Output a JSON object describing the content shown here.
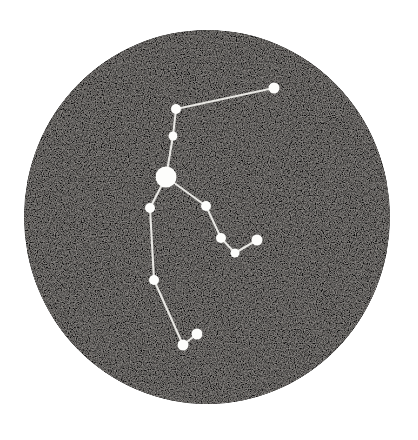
{
  "figure": {
    "background_color": "#ffffff",
    "canvas": {
      "width": 418,
      "height": 440
    }
  },
  "sky_disc": {
    "name": "circular sky field",
    "center_x": 207,
    "center_y": 217,
    "radius_x": 183,
    "radius_y": 187,
    "fill_color": "#0d0c0c",
    "texture": "grainy halftone speckle with faint horizontal banding",
    "speckle_color": "#6e6a66"
  },
  "chart_data": {
    "type": "scatter",
    "xlabel": "",
    "ylabel": "",
    "xlim": [
      24,
      390
    ],
    "ylim": [
      30,
      405
    ],
    "grid": false,
    "legend": "none",
    "star_color": "#fdfdfb",
    "line_color": "#e8e7e3",
    "stars": [
      {
        "id": "s1",
        "x": 274,
        "y": 88,
        "r": 5.5,
        "magnitude_rank": 2
      },
      {
        "id": "s2",
        "x": 176,
        "y": 109,
        "r": 5.0,
        "magnitude_rank": 3
      },
      {
        "id": "s3",
        "x": 173,
        "y": 136,
        "r": 4.5,
        "magnitude_rank": 4
      },
      {
        "id": "s4",
        "x": 166,
        "y": 177,
        "r": 10.5,
        "magnitude_rank": 1
      },
      {
        "id": "s5",
        "x": 150,
        "y": 208,
        "r": 5.0,
        "magnitude_rank": 3
      },
      {
        "id": "s6",
        "x": 206,
        "y": 206,
        "r": 5.0,
        "magnitude_rank": 3
      },
      {
        "id": "s7",
        "x": 221,
        "y": 238,
        "r": 5.0,
        "magnitude_rank": 3
      },
      {
        "id": "s8",
        "x": 235,
        "y": 253,
        "r": 4.5,
        "magnitude_rank": 4
      },
      {
        "id": "s9",
        "x": 257,
        "y": 240,
        "r": 5.5,
        "magnitude_rank": 2
      },
      {
        "id": "s10",
        "x": 154,
        "y": 280,
        "r": 5.0,
        "magnitude_rank": 3
      },
      {
        "id": "s11",
        "x": 183,
        "y": 345,
        "r": 5.5,
        "magnitude_rank": 2
      },
      {
        "id": "s12",
        "x": 197,
        "y": 334,
        "r": 5.5,
        "magnitude_rank": 2
      }
    ],
    "links": [
      {
        "from": "s1",
        "to": "s2"
      },
      {
        "from": "s2",
        "to": "s3"
      },
      {
        "from": "s3",
        "to": "s4"
      },
      {
        "from": "s4",
        "to": "s5"
      },
      {
        "from": "s4",
        "to": "s6"
      },
      {
        "from": "s6",
        "to": "s7"
      },
      {
        "from": "s7",
        "to": "s8"
      },
      {
        "from": "s8",
        "to": "s9"
      },
      {
        "from": "s5",
        "to": "s10"
      },
      {
        "from": "s10",
        "to": "s11"
      },
      {
        "from": "s11",
        "to": "s12"
      }
    ]
  }
}
